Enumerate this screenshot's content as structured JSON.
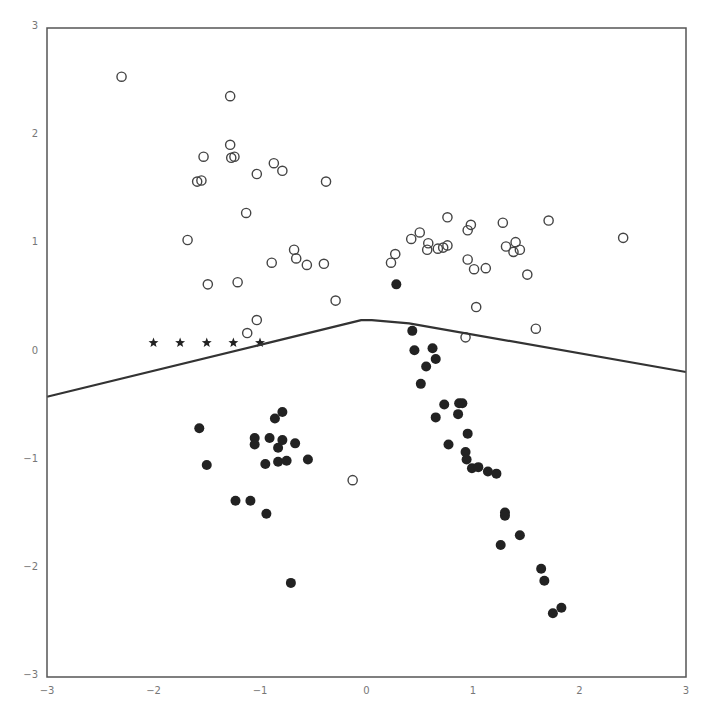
{
  "chart_data": {
    "type": "scatter",
    "title": "",
    "xlabel": "",
    "ylabel": "",
    "xlim": [
      -3,
      3
    ],
    "ylim": [
      -3,
      3
    ],
    "grid": false,
    "legend": null,
    "x_ticks": [
      "-3",
      "-2",
      "-1",
      "0",
      "1",
      "2",
      "3"
    ],
    "y_ticks": [
      "-3",
      "-2",
      "-1",
      "0",
      "1",
      "2",
      "3"
    ],
    "colors": {
      "frame": "#555555",
      "tick_label": "#777777",
      "open_marker_edge": "#444444",
      "filled_marker": "#222222",
      "line": "#333333",
      "star": "#222222"
    },
    "series": [
      {
        "name": "class-open",
        "marker": "open-circle",
        "points": [
          [
            -2.3,
            2.55
          ],
          [
            -1.28,
            2.37
          ],
          [
            -1.28,
            1.92
          ],
          [
            -1.53,
            1.81
          ],
          [
            -1.27,
            1.8
          ],
          [
            -1.24,
            1.81
          ],
          [
            -0.87,
            1.75
          ],
          [
            -0.79,
            1.68
          ],
          [
            -1.03,
            1.65
          ],
          [
            -0.38,
            1.58
          ],
          [
            -1.59,
            1.58
          ],
          [
            -1.55,
            1.59
          ],
          [
            -1.13,
            1.29
          ],
          [
            -1.68,
            1.04
          ],
          [
            -0.68,
            0.95
          ],
          [
            -0.66,
            0.87
          ],
          [
            -0.56,
            0.81
          ],
          [
            -0.4,
            0.82
          ],
          [
            -0.89,
            0.83
          ],
          [
            -1.21,
            0.65
          ],
          [
            -1.49,
            0.63
          ],
          [
            -0.29,
            0.48
          ],
          [
            -1.03,
            0.3
          ],
          [
            -1.12,
            0.18
          ],
          [
            -0.13,
            -1.18
          ],
          [
            0.23,
            0.83
          ],
          [
            0.27,
            0.91
          ],
          [
            0.42,
            1.05
          ],
          [
            0.5,
            1.11
          ],
          [
            0.57,
            0.95
          ],
          [
            0.58,
            1.01
          ],
          [
            0.67,
            0.96
          ],
          [
            0.72,
            0.97
          ],
          [
            0.76,
            0.99
          ],
          [
            0.76,
            1.25
          ],
          [
            0.95,
            1.13
          ],
          [
            0.98,
            1.18
          ],
          [
            0.95,
            0.86
          ],
          [
            1.01,
            0.77
          ],
          [
            1.12,
            0.78
          ],
          [
            1.03,
            0.42
          ],
          [
            1.28,
            1.2
          ],
          [
            1.31,
            0.98
          ],
          [
            1.38,
            0.93
          ],
          [
            1.4,
            1.02
          ],
          [
            1.44,
            0.95
          ],
          [
            1.51,
            0.72
          ],
          [
            1.71,
            1.22
          ],
          [
            1.59,
            0.22
          ],
          [
            0.93,
            0.14
          ],
          [
            2.41,
            1.06
          ]
        ]
      },
      {
        "name": "class-filled",
        "marker": "filled-circle",
        "points": [
          [
            0.28,
            0.63
          ],
          [
            0.43,
            0.2
          ],
          [
            0.45,
            0.02
          ],
          [
            0.62,
            0.04
          ],
          [
            0.65,
            -0.06
          ],
          [
            0.56,
            -0.13
          ],
          [
            0.51,
            -0.29
          ],
          [
            0.65,
            -0.6
          ],
          [
            0.73,
            -0.48
          ],
          [
            0.87,
            -0.47
          ],
          [
            0.9,
            -0.47
          ],
          [
            0.86,
            -0.57
          ],
          [
            0.95,
            -0.75
          ],
          [
            0.77,
            -0.85
          ],
          [
            0.93,
            -0.92
          ],
          [
            0.94,
            -0.99
          ],
          [
            0.99,
            -1.07
          ],
          [
            1.05,
            -1.06
          ],
          [
            1.14,
            -1.1
          ],
          [
            1.22,
            -1.12
          ],
          [
            1.3,
            -1.48
          ],
          [
            1.3,
            -1.51
          ],
          [
            1.44,
            -1.69
          ],
          [
            1.26,
            -1.78
          ],
          [
            1.64,
            -2.0
          ],
          [
            1.67,
            -2.11
          ],
          [
            1.75,
            -2.41
          ],
          [
            1.83,
            -2.36
          ],
          [
            -1.57,
            -0.7
          ],
          [
            -1.5,
            -1.04
          ],
          [
            -1.05,
            -0.79
          ],
          [
            -1.05,
            -0.85
          ],
          [
            -0.91,
            -0.79
          ],
          [
            -0.86,
            -0.61
          ],
          [
            -0.79,
            -0.55
          ],
          [
            -0.83,
            -0.88
          ],
          [
            -0.79,
            -0.81
          ],
          [
            -0.83,
            -1.01
          ],
          [
            -0.75,
            -1.0
          ],
          [
            -0.95,
            -1.03
          ],
          [
            -0.67,
            -0.84
          ],
          [
            -0.55,
            -0.99
          ],
          [
            -1.23,
            -1.37
          ],
          [
            -1.09,
            -1.37
          ],
          [
            -0.94,
            -1.49
          ],
          [
            -0.71,
            -2.13
          ]
        ]
      },
      {
        "name": "stars",
        "marker": "star",
        "points": [
          [
            -2.0,
            0.09
          ],
          [
            -1.75,
            0.09
          ],
          [
            -1.5,
            0.09
          ],
          [
            -1.25,
            0.09
          ],
          [
            -1.0,
            0.09
          ]
        ]
      },
      {
        "name": "decision-boundary",
        "marker": "line",
        "points": [
          [
            -3.0,
            -0.41
          ],
          [
            -1.0,
            0.07
          ],
          [
            -0.05,
            0.3
          ],
          [
            0.05,
            0.3
          ],
          [
            0.4,
            0.27
          ],
          [
            3.0,
            -0.18
          ]
        ]
      }
    ]
  },
  "plot_box": {
    "left": 47,
    "top": 28,
    "right": 686,
    "bottom": 677
  }
}
